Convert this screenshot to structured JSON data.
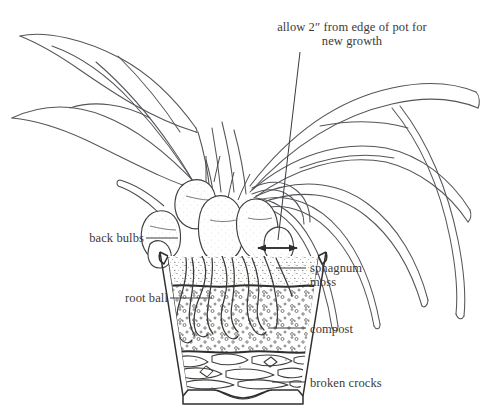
{
  "figure": {
    "background_color": "#ffffff",
    "ink_color": "#3a3a38",
    "style": "pen-and-ink botanical line drawing"
  },
  "annotations": {
    "callout": {
      "line1": "allow 2″ from edge of pot for",
      "line2": "new growth"
    },
    "back_bulbs": "back bulbs",
    "root_ball": "root ball",
    "sphagnum_moss": {
      "line1": "sphagnum",
      "line2": "moss"
    },
    "compost": "compost",
    "broken_crocks": "broken crocks"
  },
  "layers": [
    {
      "name": "sphagnum moss",
      "position": "top",
      "label": "sphagnum moss"
    },
    {
      "name": "compost",
      "position": "middle",
      "label": "compost"
    },
    {
      "name": "broken crocks",
      "position": "bottom",
      "label": "broken crocks"
    }
  ],
  "measurement": {
    "value": "2″",
    "description": "clearance between back bulbs and the pot rim",
    "arrow_style": "double-headed"
  }
}
